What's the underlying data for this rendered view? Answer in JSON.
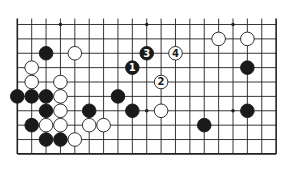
{
  "diagram": {
    "type": "go-board-fragment",
    "columns": 19,
    "rows_shown": 10,
    "open_edge": "top",
    "colors": {
      "line": "#222222",
      "black": "#1a1a1a",
      "white": "#ffffff",
      "background": "#ffffff"
    },
    "hoshi": [
      [
        3,
        0
      ],
      [
        9,
        0
      ],
      [
        15,
        0
      ],
      [
        9,
        6
      ],
      [
        15,
        6
      ]
    ],
    "stones": [
      {
        "c": 14,
        "r": 1,
        "color": "white"
      },
      {
        "c": 16,
        "r": 1,
        "color": "white"
      },
      {
        "c": 2,
        "r": 2,
        "color": "black"
      },
      {
        "c": 4,
        "r": 2,
        "color": "white"
      },
      {
        "c": 9,
        "r": 2,
        "color": "black",
        "label": "3"
      },
      {
        "c": 11,
        "r": 2,
        "color": "white",
        "label": "4"
      },
      {
        "c": 1,
        "r": 3,
        "color": "white"
      },
      {
        "c": 8,
        "r": 3,
        "color": "black",
        "label": "1"
      },
      {
        "c": 16,
        "r": 3,
        "color": "black"
      },
      {
        "c": 1,
        "r": 4,
        "color": "white"
      },
      {
        "c": 3,
        "r": 4,
        "color": "white"
      },
      {
        "c": 10,
        "r": 4,
        "color": "white",
        "label": "2"
      },
      {
        "c": 0,
        "r": 5,
        "color": "black"
      },
      {
        "c": 1,
        "r": 5,
        "color": "black"
      },
      {
        "c": 2,
        "r": 5,
        "color": "black"
      },
      {
        "c": 3,
        "r": 5,
        "color": "white"
      },
      {
        "c": 7,
        "r": 5,
        "color": "black"
      },
      {
        "c": 2,
        "r": 6,
        "color": "black"
      },
      {
        "c": 3,
        "r": 6,
        "color": "white"
      },
      {
        "c": 5,
        "r": 6,
        "color": "black"
      },
      {
        "c": 8,
        "r": 6,
        "color": "black"
      },
      {
        "c": 10,
        "r": 6,
        "color": "white"
      },
      {
        "c": 16,
        "r": 6,
        "color": "black"
      },
      {
        "c": 1,
        "r": 7,
        "color": "black"
      },
      {
        "c": 2,
        "r": 7,
        "color": "white"
      },
      {
        "c": 3,
        "r": 7,
        "color": "white"
      },
      {
        "c": 5,
        "r": 7,
        "color": "white"
      },
      {
        "c": 6,
        "r": 7,
        "color": "white"
      },
      {
        "c": 13,
        "r": 7,
        "color": "black"
      },
      {
        "c": 2,
        "r": 8,
        "color": "black"
      },
      {
        "c": 3,
        "r": 8,
        "color": "black"
      },
      {
        "c": 4,
        "r": 8,
        "color": "white"
      }
    ]
  }
}
